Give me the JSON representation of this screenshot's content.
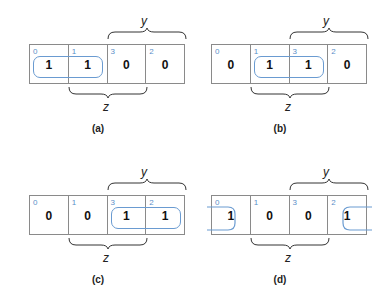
{
  "panels": [
    {
      "caption": "(a)",
      "cells": [
        {
          "index": "0",
          "value": "1"
        },
        {
          "index": "1",
          "value": "1"
        },
        {
          "index": "3",
          "value": "0"
        },
        {
          "index": "2",
          "value": "0"
        }
      ],
      "group": "cells 0-1",
      "y_label": "y",
      "z_label": "z"
    },
    {
      "caption": "(b)",
      "cells": [
        {
          "index": "0",
          "value": "0"
        },
        {
          "index": "1",
          "value": "1"
        },
        {
          "index": "3",
          "value": "1"
        },
        {
          "index": "2",
          "value": "0"
        }
      ],
      "group": "cells 1-3",
      "y_label": "y",
      "z_label": "z"
    },
    {
      "caption": "(c)",
      "cells": [
        {
          "index": "0",
          "value": "0"
        },
        {
          "index": "1",
          "value": "0"
        },
        {
          "index": "3",
          "value": "1"
        },
        {
          "index": "2",
          "value": "1"
        }
      ],
      "group": "cells 3-2",
      "y_label": "y",
      "z_label": "z"
    },
    {
      "caption": "(d)",
      "cells": [
        {
          "index": "0",
          "value": "1"
        },
        {
          "index": "1",
          "value": "0"
        },
        {
          "index": "3",
          "value": "0"
        },
        {
          "index": "2",
          "value": "1"
        }
      ],
      "group": "cells 0-2 (wraparound)",
      "y_label": "y",
      "z_label": "z"
    }
  ],
  "colors": {
    "grid": "#8a8a8a",
    "index": "#5b8fc9",
    "loop": "#6a9bd1",
    "text": "#111111"
  }
}
